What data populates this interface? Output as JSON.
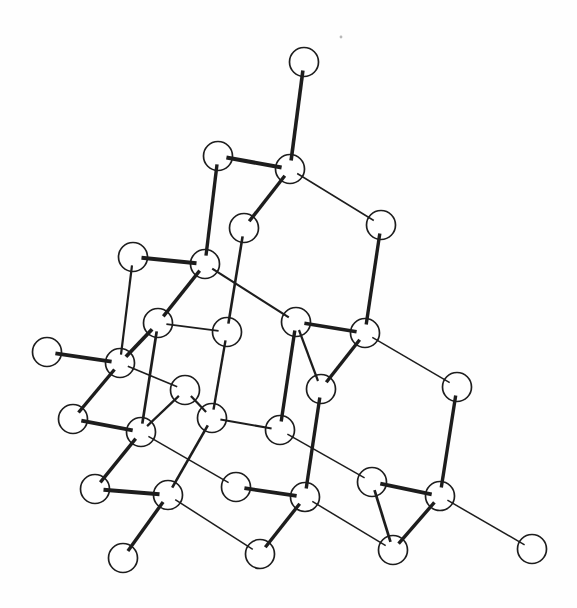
{
  "figure": {
    "type": "ball-and-stick-lattice",
    "canvas": {
      "width": 577,
      "height": 608,
      "background": "#fefefe"
    },
    "node_style": {
      "radius": 14.5,
      "fill": "#ffffff",
      "stroke": "#1d1d1d",
      "stroke_width": 1.7
    },
    "bond_style": {
      "color": "#1d1d1d",
      "end_inset": 8.5
    },
    "atoms": [
      {
        "id": "n1",
        "x": 304,
        "y": 62
      },
      {
        "id": "n2",
        "x": 218,
        "y": 156
      },
      {
        "id": "n3",
        "x": 290,
        "y": 169
      },
      {
        "id": "n4",
        "x": 381,
        "y": 225
      },
      {
        "id": "n5",
        "x": 244,
        "y": 228
      },
      {
        "id": "n6",
        "x": 133,
        "y": 257
      },
      {
        "id": "n7",
        "x": 205,
        "y": 264
      },
      {
        "id": "n8",
        "x": 158,
        "y": 323
      },
      {
        "id": "n9",
        "x": 227,
        "y": 332
      },
      {
        "id": "n10",
        "x": 296,
        "y": 322
      },
      {
        "id": "n11",
        "x": 365,
        "y": 333
      },
      {
        "id": "n12",
        "x": 47,
        "y": 352
      },
      {
        "id": "n13",
        "x": 120,
        "y": 363
      },
      {
        "id": "n14",
        "x": 185,
        "y": 390
      },
      {
        "id": "n15",
        "x": 321,
        "y": 389
      },
      {
        "id": "n16",
        "x": 457,
        "y": 387
      },
      {
        "id": "n17",
        "x": 73,
        "y": 419
      },
      {
        "id": "n18",
        "x": 212,
        "y": 418
      },
      {
        "id": "n19",
        "x": 141,
        "y": 432
      },
      {
        "id": "n20",
        "x": 280,
        "y": 430
      },
      {
        "id": "n21",
        "x": 95,
        "y": 489
      },
      {
        "id": "n22",
        "x": 168,
        "y": 495
      },
      {
        "id": "n23",
        "x": 236,
        "y": 487
      },
      {
        "id": "n24",
        "x": 305,
        "y": 497
      },
      {
        "id": "n25",
        "x": 372,
        "y": 482
      },
      {
        "id": "n26",
        "x": 440,
        "y": 496
      },
      {
        "id": "n27",
        "x": 123,
        "y": 558
      },
      {
        "id": "n28",
        "x": 260,
        "y": 554
      },
      {
        "id": "n29",
        "x": 393,
        "y": 550
      },
      {
        "id": "n30",
        "x": 532,
        "y": 549
      }
    ],
    "bonds": [
      {
        "from": "n1",
        "to": "n3",
        "width": 3.6
      },
      {
        "from": "n2",
        "to": "n3",
        "width": 4.0
      },
      {
        "from": "n2",
        "to": "n7",
        "width": 3.4
      },
      {
        "from": "n3",
        "to": "n5",
        "width": 3.4
      },
      {
        "from": "n3",
        "to": "n4",
        "width": 1.5
      },
      {
        "from": "n4",
        "to": "n11",
        "width": 3.4
      },
      {
        "from": "n5",
        "to": "n9",
        "width": 2.6
      },
      {
        "from": "n6",
        "to": "n7",
        "width": 4.0
      },
      {
        "from": "n6",
        "to": "n13",
        "width": 2.2
      },
      {
        "from": "n7",
        "to": "n8",
        "width": 3.4
      },
      {
        "from": "n7",
        "to": "n10",
        "width": 2.2
      },
      {
        "from": "n8",
        "to": "n13",
        "width": 3.8
      },
      {
        "from": "n8",
        "to": "n9",
        "width": 1.8
      },
      {
        "from": "n8",
        "to": "n19",
        "width": 2.7
      },
      {
        "from": "n9",
        "to": "n18",
        "width": 2.4
      },
      {
        "from": "n10",
        "to": "n11",
        "width": 3.4
      },
      {
        "from": "n10",
        "to": "n20",
        "width": 3.4
      },
      {
        "from": "n10",
        "to": "n15",
        "width": 2.2
      },
      {
        "from": "n11",
        "to": "n15",
        "width": 3.4
      },
      {
        "from": "n11",
        "to": "n16",
        "width": 1.5
      },
      {
        "from": "n12",
        "to": "n13",
        "width": 3.8
      },
      {
        "from": "n13",
        "to": "n17",
        "width": 3.4
      },
      {
        "from": "n13",
        "to": "n14",
        "width": 1.6
      },
      {
        "from": "n14",
        "to": "n19",
        "width": 2.2
      },
      {
        "from": "n14",
        "to": "n18",
        "width": 2.2
      },
      {
        "from": "n18",
        "to": "n20",
        "width": 2.2
      },
      {
        "from": "n18",
        "to": "n22",
        "width": 2.6
      },
      {
        "from": "n17",
        "to": "n19",
        "width": 3.8
      },
      {
        "from": "n19",
        "to": "n21",
        "width": 3.4
      },
      {
        "from": "n19",
        "to": "n23",
        "width": 1.5
      },
      {
        "from": "n20",
        "to": "n25",
        "width": 1.5
      },
      {
        "from": "n15",
        "to": "n24",
        "width": 3.4
      },
      {
        "from": "n16",
        "to": "n26",
        "width": 3.4
      },
      {
        "from": "n21",
        "to": "n22",
        "width": 4.0
      },
      {
        "from": "n22",
        "to": "n27",
        "width": 3.4
      },
      {
        "from": "n22",
        "to": "n28",
        "width": 1.5
      },
      {
        "from": "n23",
        "to": "n24",
        "width": 3.8
      },
      {
        "from": "n24",
        "to": "n28",
        "width": 3.4
      },
      {
        "from": "n24",
        "to": "n29",
        "width": 1.5
      },
      {
        "from": "n25",
        "to": "n26",
        "width": 3.8
      },
      {
        "from": "n25",
        "to": "n29",
        "width": 2.7
      },
      {
        "from": "n26",
        "to": "n29",
        "width": 3.4
      },
      {
        "from": "n26",
        "to": "n30",
        "width": 1.5
      }
    ],
    "specks": [
      {
        "x": 341,
        "y": 37,
        "r": 1.4,
        "color": "#b8b8b8"
      }
    ]
  }
}
